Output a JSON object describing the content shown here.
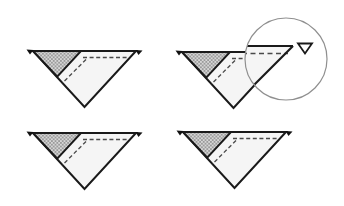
{
  "diagram": {
    "kind": "quilt-piecing-diagram",
    "units": [
      {
        "id": "triangle-unit-1",
        "row": 1,
        "col": 1,
        "x": 33,
        "y": 51,
        "has_magnifier": false
      },
      {
        "id": "triangle-unit-2",
        "row": 1,
        "col": 2,
        "x": 182,
        "y": 52,
        "has_magnifier": true
      },
      {
        "id": "triangle-unit-3",
        "row": 2,
        "col": 1,
        "x": 33,
        "y": 133,
        "has_magnifier": false
      },
      {
        "id": "triangle-unit-4",
        "row": 2,
        "col": 2,
        "x": 183,
        "y": 132,
        "has_magnifier": true
      }
    ],
    "unit_parts": {
      "body": "down-pointing-triangle",
      "patch": "crosshatched-corner-triangle-top-left",
      "seams": [
        "dashed-line-below-top-edge",
        "dashed-line-along-patch-hypotenuse"
      ],
      "markers": [
        "solid-corner-marker-top-left",
        "solid-corner-marker-top-right"
      ]
    },
    "magnifier": {
      "attached_to": "triangle-unit-2",
      "shows": "top-right-corner-detail",
      "detail_parts": [
        "top-edge",
        "dashed-seam-line",
        "diagonal-right-edge",
        "open-corner-marker"
      ],
      "cx": 286,
      "cy": 59,
      "r": 41
    }
  },
  "colors": {
    "page_bg": "#ffffff",
    "unit_fill": "#f5f5f5",
    "outline": "#1a1a1a",
    "patch_light": "#d6d6d6",
    "patch_dark": "#9b9b9b",
    "dash": "#4a4a4a",
    "marker_fill": "#111111",
    "lens_stroke": "#8f8f8f",
    "magnified_marker_fill": "#ffffff"
  }
}
